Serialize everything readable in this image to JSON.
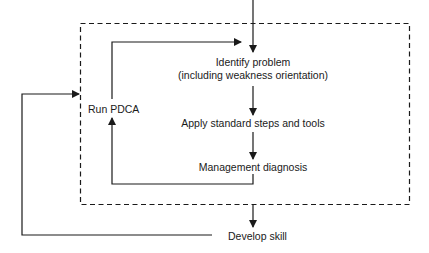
{
  "diagram": {
    "nodes": {
      "identify_problem": {
        "line1": "Identify problem",
        "line2": "(including weakness orientation)"
      },
      "apply_steps": {
        "label": "Apply standard steps and tools"
      },
      "management_diagnosis": {
        "label": "Management diagnosis"
      },
      "run_pdca": {
        "label": "Run PDCA"
      },
      "develop_skill": {
        "label": "Develop skill"
      }
    },
    "edges": [
      {
        "from": "entry",
        "to": "identify_problem"
      },
      {
        "from": "identify_problem",
        "to": "apply_steps"
      },
      {
        "from": "apply_steps",
        "to": "management_diagnosis"
      },
      {
        "from": "management_diagnosis",
        "to": "run_pdca"
      },
      {
        "from": "run_pdca",
        "to": "identify_problem"
      },
      {
        "from": "dashed_boundary",
        "to": "develop_skill"
      },
      {
        "from": "develop_skill",
        "to": "dashed_boundary"
      }
    ],
    "colors": {
      "line": "#1a1a1a",
      "background": "#ffffff"
    }
  }
}
